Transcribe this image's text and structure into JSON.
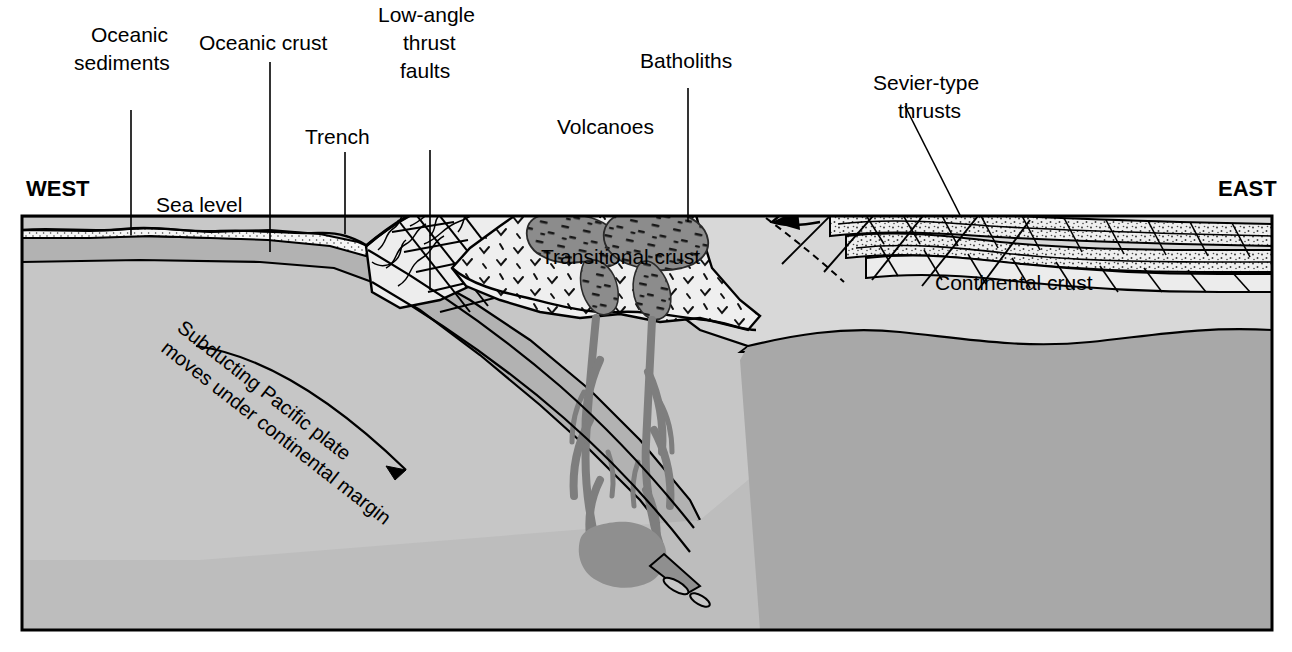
{
  "figure": {
    "type": "geologic-cross-section",
    "orientation": {
      "left": "WEST",
      "right": "EAST"
    }
  },
  "labels": {
    "west": "WEST",
    "east": "EAST",
    "sea_level": "Sea level",
    "oceanic_sediments": {
      "line1": "Oceanic",
      "line2": "sediments"
    },
    "oceanic_crust": "Oceanic crust",
    "trench": "Trench",
    "low_angle_thrust_faults": {
      "line1": "Low-angle",
      "line2": "thrust",
      "line3": "faults"
    },
    "volcanoes": "Volcanoes",
    "batholiths": "Batholiths",
    "sevier_type_thrusts": {
      "line1": "Sevier-type",
      "line2": "thrusts"
    },
    "transitional_crust": "Transitional crust",
    "continental_crust": "Continental crust",
    "subducting_plate": {
      "line1": "Subducting Pacific plate",
      "line2": "moves under continental margin"
    }
  },
  "colors": {
    "background": "#ffffff",
    "water": "#d0d0d0",
    "sediment": "#f4f4f4",
    "oceanic_crust": "#b2b2b2",
    "mantle": "#a8a8a8",
    "mantle_deep": "#c6c6c6",
    "continental_crust": "#d8d8d8",
    "transitional_crust": "#efefef",
    "batholith": "#8c8c8c",
    "magma": "#8f8f8f",
    "stroke": "#000000",
    "frame": "#000000"
  },
  "units": [
    {
      "name": "water",
      "label": "Sea level",
      "fill": "#d0d0d0"
    },
    {
      "name": "oceanic-sediments",
      "label": "Oceanic sediments",
      "fill": "#f4f4f4",
      "texture": "stipple"
    },
    {
      "name": "oceanic-crust",
      "label": "Oceanic crust",
      "fill": "#b2b2b2"
    },
    {
      "name": "mantle",
      "label": "Mantle",
      "fill": "#c6c6c6"
    },
    {
      "name": "accretionary-wedge",
      "label": "Low-angle thrust faults",
      "fill": "#efefef",
      "texture": "blocks"
    },
    {
      "name": "transitional-crust",
      "label": "Transitional crust",
      "fill": "#efefef",
      "texture": "chevrons"
    },
    {
      "name": "batholiths",
      "label": "Batholiths",
      "fill": "#8c8c8c",
      "texture": "dashes"
    },
    {
      "name": "continental-crust",
      "label": "Continental crust",
      "fill": "#d8d8d8"
    },
    {
      "name": "sevier-thrust-sheets",
      "label": "Sevier-type thrusts",
      "fill": "#ececec",
      "texture": "stipple"
    }
  ]
}
